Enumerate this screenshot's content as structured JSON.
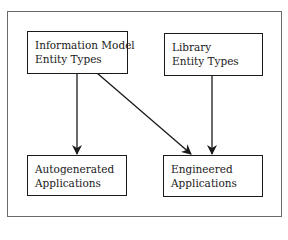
{
  "diagram": {
    "nodes": [
      {
        "id": "info-model",
        "lines": [
          "Information Model",
          "Entity Types"
        ]
      },
      {
        "id": "library",
        "lines": [
          "Library",
          "Entity Types"
        ]
      },
      {
        "id": "autogenerated",
        "lines": [
          "Autogenerated",
          "Applications"
        ]
      },
      {
        "id": "engineered",
        "lines": [
          "Engineered",
          "Applications"
        ]
      }
    ],
    "edges": [
      {
        "from": "info-model",
        "to": "autogenerated"
      },
      {
        "from": "info-model",
        "to": "engineered"
      },
      {
        "from": "library",
        "to": "engineered"
      }
    ]
  }
}
